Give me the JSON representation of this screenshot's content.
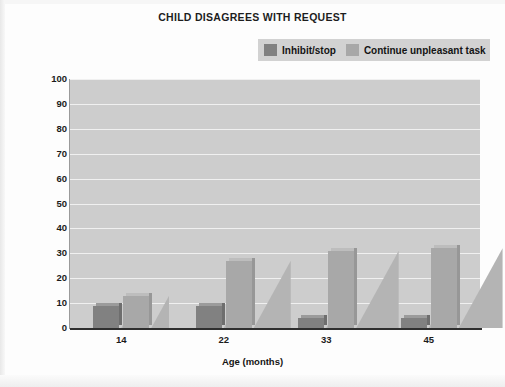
{
  "chart_data": {
    "type": "bar",
    "title": "CHILD DISAGREES WITH REQUEST",
    "xlabel": "Age (months)",
    "ylabel": "Percentage of requests coded",
    "categories": [
      "14",
      "22",
      "33",
      "45"
    ],
    "ylim": [
      0,
      100
    ],
    "yticks": [
      "0",
      "10",
      "20",
      "30",
      "40",
      "50",
      "60",
      "70",
      "80",
      "90",
      "100"
    ],
    "grid": true,
    "legend_position": "top-right",
    "series": [
      {
        "name": "Inhibit/stop",
        "color": "#818181",
        "values": [
          9,
          9,
          4,
          4
        ]
      },
      {
        "name": "Continue unpleasant task",
        "color": "#a8a8a8",
        "values": [
          13,
          27,
          31,
          32
        ]
      }
    ]
  },
  "colors": {
    "plot_background": "#cdcdcd",
    "gridline": "#f0f0f0",
    "legend_background": "#d2d2d2",
    "axis": "#2f2f2f",
    "page_background": "#fdfdfd"
  }
}
